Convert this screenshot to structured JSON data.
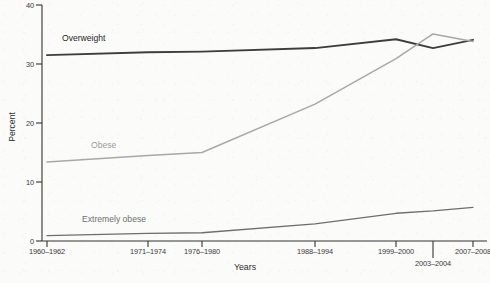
{
  "chart_data": {
    "type": "line",
    "title": "",
    "subtitle": "",
    "xlabel": "Years",
    "ylabel": "Percent",
    "categories": [
      "1960–1962",
      "1971–1974",
      "1976–1980",
      "1988–1994",
      "1999–2000",
      "2003–2004",
      "2007–2008"
    ],
    "ylim": [
      0,
      40
    ],
    "yticks": [
      0,
      10,
      20,
      30,
      40
    ],
    "ytick_labels": [
      "0",
      "10",
      "20",
      "30",
      "40"
    ],
    "grid": false,
    "legend_position": "inline-on-plot",
    "series": [
      {
        "name": "Overweight",
        "color": "#3d3d3d",
        "values": [
          31.5,
          32.0,
          32.1,
          32.7,
          34.2,
          32.7,
          34.1
        ]
      },
      {
        "name": "Obese",
        "color": "#a8a8a8",
        "values": [
          13.4,
          14.5,
          15.0,
          23.2,
          30.9,
          35.1,
          33.8
        ]
      },
      {
        "name": "Extremely obese",
        "color": "#6e6e6e",
        "values": [
          0.9,
          1.3,
          1.4,
          2.9,
          4.7,
          5.1,
          5.7
        ]
      }
    ],
    "annotations": [
      {
        "text": "Overweight",
        "series": "Overweight"
      },
      {
        "text": "Obese",
        "series": "Obese"
      },
      {
        "text": "Extremely obese",
        "series": "Extremely obese"
      }
    ]
  },
  "axes": {
    "y_title": "Percent",
    "x_title": "Years",
    "y_tick_0": "0",
    "y_tick_1": "10",
    "y_tick_2": "20",
    "y_tick_3": "30",
    "y_tick_4": "40",
    "x_tick_0": "1960–1962",
    "x_tick_1": "1971–1974",
    "x_tick_2": "1976–1980",
    "x_tick_3": "1988–1994",
    "x_tick_4": "1999–2000",
    "x_tick_5": "2003–2004",
    "x_tick_6": "2007–2008"
  },
  "labels": {
    "overweight": "Overweight",
    "obese": "Obese",
    "extremely_obese": "Extremely obese"
  }
}
